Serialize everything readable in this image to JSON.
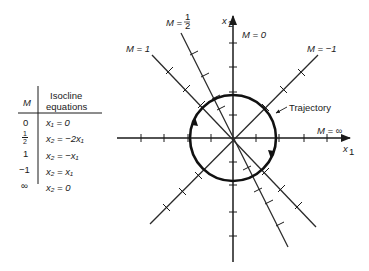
{
  "table": {
    "header_m": "M",
    "header_eq_line1": "Isocline",
    "header_eq_line2": "equations",
    "rows": [
      {
        "m": "0",
        "eq": "x₁ = 0"
      },
      {
        "m": "1/2",
        "m_num": "1",
        "m_den": "2",
        "eq": "x₂ = −2x₁"
      },
      {
        "m": "1",
        "eq": "x₂ = −x₁"
      },
      {
        "m": "−1",
        "eq": "x₂ = x₁"
      },
      {
        "m": "∞",
        "eq": "x₂ = 0"
      }
    ]
  },
  "diagram": {
    "axis_x_label": "x",
    "axis_x_sub": "1",
    "axis_y_label": "x",
    "axis_y_sub": "2",
    "trajectory_label": "Trajectory",
    "isocline_labels": {
      "m_half_prefix": "M =",
      "m_half_num": "1",
      "m_half_den": "2",
      "m_one": "M = 1",
      "m_zero": "M = 0",
      "m_neg_one": "M = −1",
      "m_inf": "M = ∞"
    }
  },
  "colors": {
    "ink": "#1a1a1a",
    "background": "#ffffff"
  }
}
